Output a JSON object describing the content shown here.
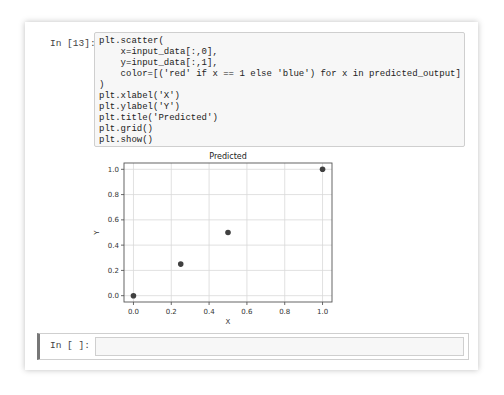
{
  "cells": [
    {
      "prompt": "In [13]:",
      "code_lines": [
        "plt.scatter(",
        "    x=input_data[:,0],",
        "    y=input_data[:,1],",
        "    color=[('red' if x == 1 else 'blue') for x in predicted_output]",
        ")",
        "plt.xlabel('X')",
        "plt.ylabel('Y')",
        "plt.title('Predicted')",
        "plt.grid()",
        "plt.show()"
      ]
    },
    {
      "prompt": "In [ ]:",
      "code_lines": []
    }
  ],
  "chart_data": {
    "type": "scatter",
    "title": "Predicted",
    "xlabel": "X",
    "ylabel": "Y",
    "x": [
      0.0,
      0.25,
      0.5,
      1.0
    ],
    "y": [
      0.0,
      0.25,
      0.5,
      1.0
    ],
    "xticks": [
      "0.0",
      "0.2",
      "0.4",
      "0.6",
      "0.8",
      "1.0"
    ],
    "yticks": [
      "0.0",
      "0.2",
      "0.4",
      "0.6",
      "0.8",
      "1.0"
    ],
    "xlim": [
      -0.05,
      1.05
    ],
    "ylim": [
      -0.05,
      1.05
    ],
    "grid": true,
    "marker_color": "#404040"
  }
}
